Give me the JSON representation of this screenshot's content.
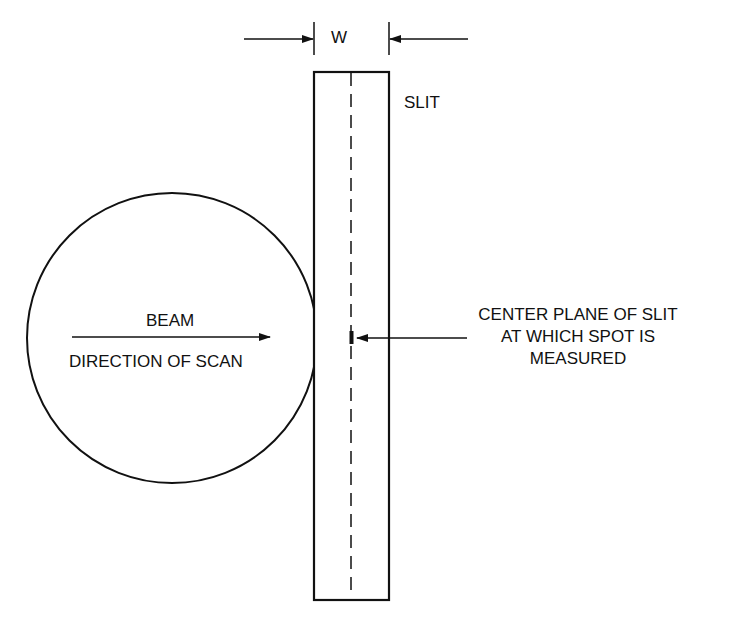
{
  "diagram": {
    "title": "",
    "labels": {
      "width": "W",
      "slit": "SLIT",
      "beam": "BEAM",
      "direction": "DIRECTION OF SCAN",
      "center_plane": [
        "CENTER PLANE OF SLIT",
        "AT WHICH SPOT IS",
        "MEASURED"
      ]
    },
    "shapes": {
      "beam_circle": {
        "cx": 172,
        "cy": 338,
        "r": 145
      },
      "slit_rect": {
        "x": 314,
        "y": 72,
        "w": 75,
        "h": 528
      },
      "centerline_x": 351
    },
    "colors": {
      "stroke": "#111111",
      "background": "#ffffff"
    }
  }
}
